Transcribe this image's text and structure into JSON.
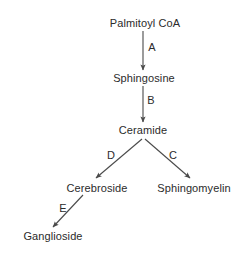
{
  "diagram": {
    "type": "flowchart",
    "background_color": "#ffffff",
    "text_color": "#2b2b2b",
    "line_color": "#4a4a4a",
    "nodes": [
      {
        "id": "palmitoyl-coa",
        "label": "Palmitoyl CoA",
        "cx": 145,
        "cy": 23
      },
      {
        "id": "sphingosine",
        "label": "Sphingosine",
        "cx": 144,
        "cy": 78
      },
      {
        "id": "ceramide",
        "label": "Ceramide",
        "cx": 143,
        "cy": 130
      },
      {
        "id": "cerebroside",
        "label": "Cerebroside",
        "cx": 97,
        "cy": 188
      },
      {
        "id": "sphingomyelin",
        "label": "Sphingomyelin",
        "cx": 194,
        "cy": 188
      },
      {
        "id": "ganglioside",
        "label": "Ganglioside",
        "cx": 53,
        "cy": 236
      }
    ],
    "edges": [
      {
        "id": "edge-a",
        "label": "A",
        "from": "palmitoyl-coa",
        "to": "sphingosine",
        "x1": 143,
        "y1": 31,
        "x2": 143,
        "y2": 70,
        "lx": 152,
        "ly": 47
      },
      {
        "id": "edge-b",
        "label": "B",
        "from": "sphingosine",
        "to": "ceramide",
        "x1": 143,
        "y1": 86,
        "x2": 143,
        "y2": 122,
        "lx": 151,
        "ly": 100
      },
      {
        "id": "edge-d",
        "label": "D",
        "from": "ceramide",
        "to": "cerebroside",
        "x1": 142,
        "y1": 139,
        "x2": 96,
        "y2": 178,
        "lx": 111,
        "ly": 155
      },
      {
        "id": "edge-c",
        "label": "C",
        "from": "ceramide",
        "to": "sphingomyelin",
        "x1": 145,
        "y1": 139,
        "x2": 190,
        "y2": 178,
        "lx": 173,
        "ly": 155
      },
      {
        "id": "edge-e",
        "label": "E",
        "from": "cerebroside",
        "to": "ganglioside",
        "x1": 83,
        "y1": 195,
        "x2": 53,
        "y2": 227,
        "lx": 63,
        "ly": 208
      }
    ]
  }
}
